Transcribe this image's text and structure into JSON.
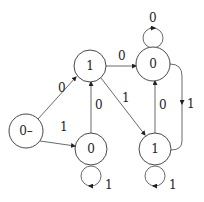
{
  "diagram": {
    "type": "state-machine",
    "nodes": [
      {
        "id": "A",
        "label": "0–",
        "cx": 26,
        "cy": 131,
        "r": 17
      },
      {
        "id": "B",
        "label": "1",
        "cx": 90,
        "cy": 66,
        "r": 16
      },
      {
        "id": "C",
        "label": "0",
        "cx": 153,
        "cy": 64,
        "r": 17
      },
      {
        "id": "D",
        "label": "0",
        "cx": 91,
        "cy": 149,
        "r": 16
      },
      {
        "id": "E",
        "label": "1",
        "cx": 155,
        "cy": 149,
        "r": 16
      }
    ],
    "edges": [
      {
        "from": "A",
        "to": "B",
        "label": "0"
      },
      {
        "from": "A",
        "to": "D",
        "label": "1"
      },
      {
        "from": "B",
        "to": "C",
        "label": "0"
      },
      {
        "from": "D",
        "to": "B",
        "label": "0"
      },
      {
        "from": "B",
        "to": "E",
        "label": "1"
      },
      {
        "from": "E",
        "to": "C",
        "label": "0"
      },
      {
        "from": "C",
        "to": "E",
        "label": "1"
      },
      {
        "from": "C",
        "to": "C",
        "label": "0"
      },
      {
        "from": "D",
        "to": "D",
        "label": "1"
      },
      {
        "from": "E",
        "to": "E",
        "label": "1"
      }
    ]
  }
}
